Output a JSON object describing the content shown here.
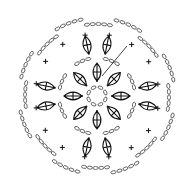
{
  "diagram": {
    "title": "Crochet granny motif chart",
    "type": "crochet-symbol-chart",
    "center": [
      97,
      96
    ],
    "colors": {
      "background": "#ffffff",
      "ink": "#111111",
      "chain": "#333333"
    },
    "rounds": [
      {
        "name": "center-ring",
        "symbol": "chain-ring",
        "radius": 9,
        "count": 8
      },
      {
        "name": "round-1-petals",
        "symbol": "treble-cluster-leaf",
        "count": 8,
        "radius": 24,
        "length": 18
      },
      {
        "name": "round-2-chain-arcs",
        "symbol": "chain-arc",
        "count": 8,
        "radius": 38
      },
      {
        "name": "round-3-leaves",
        "symbol": "treble-cluster-leaf",
        "count": 8,
        "radius": 52,
        "length": 18
      },
      {
        "name": "round-4-chain-loops",
        "symbol": "chain-arc",
        "count": 16,
        "radius": 72
      },
      {
        "name": "single-crochet-marks",
        "symbol": "single-crochet-plus",
        "count": 16,
        "radius": 62
      }
    ],
    "legend_symbols": [
      "chain-oval",
      "single-crochet-plus",
      "slip-stitch",
      "treble-cluster-leaf"
    ]
  }
}
